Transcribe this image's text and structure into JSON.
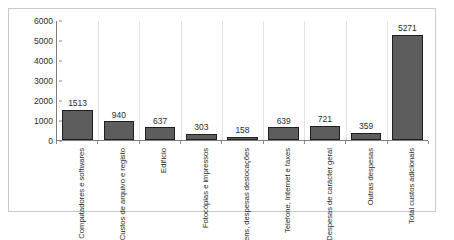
{
  "chart_data": {
    "type": "bar",
    "title": "",
    "xlabel": "",
    "ylabel": "",
    "ylim": [
      0,
      6000
    ],
    "grid": "vertical-category-separators",
    "legend": "none",
    "y_ticks": [
      0,
      1000,
      2000,
      3000,
      4000,
      5000,
      6000
    ],
    "y_tick_labels": [
      "0",
      "1000",
      "2000",
      "3000",
      "4000",
      "5000",
      "6000"
    ],
    "categories": [
      "Computadores e softwares",
      "Custos de arquivo e registo",
      "Edifício",
      "Fotocópias e impressos",
      "Viagens, despesas deslocações",
      "Telefone, Internet e faxes",
      "Despesas de carácter geral",
      "Outras despesas",
      "Total custos adicionais"
    ],
    "category_lines": [
      [
        "Computadores",
        "e softwares"
      ],
      [
        "Custos de",
        "arquivo e",
        "registo"
      ],
      [
        "Edifício"
      ],
      [
        "Fotocópias e",
        "impressos"
      ],
      [
        "Viagens,",
        "despesas",
        "deslocações"
      ],
      [
        "Telefone,",
        "Internet e",
        "faxes"
      ],
      [
        "Despesas de",
        "carácter geral"
      ],
      [
        "Outras",
        "despesas"
      ],
      [
        "Total custos",
        "adicionais"
      ]
    ],
    "values": [
      1513,
      940,
      637,
      303,
      158,
      639,
      721,
      359,
      5271
    ],
    "value_labels": [
      "1513",
      "940",
      "637",
      "303",
      "158",
      "639",
      "721",
      "359",
      "5271"
    ],
    "colors": {
      "bar_fill": "#5d5d5d",
      "bar_border": "#1f1f1f",
      "axis": "#7d7d7d",
      "gridline": "#e2e2e2",
      "text": "#1f1f1f",
      "frame": "#c9c9c9",
      "background": "#ffffff"
    }
  }
}
